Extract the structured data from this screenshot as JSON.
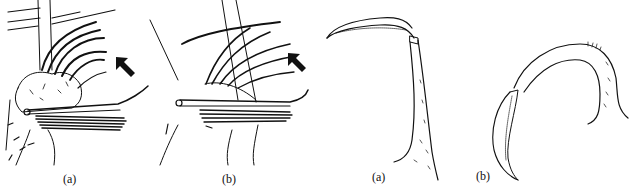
{
  "figure": {
    "panels": [
      {
        "id": "left-a",
        "label": "(a)",
        "subject": "setae-bristle-cluster",
        "has_arrow": true
      },
      {
        "id": "left-b",
        "label": "(b)",
        "subject": "setae-bristle-cluster",
        "has_arrow": true
      },
      {
        "id": "right-a",
        "label": "(a)",
        "subject": "claw-appendage-upright"
      },
      {
        "id": "right-b",
        "label": "(b)",
        "subject": "claw-appendage-curved"
      }
    ],
    "colors": {
      "ink": "#111111",
      "background": "#ffffff"
    }
  }
}
